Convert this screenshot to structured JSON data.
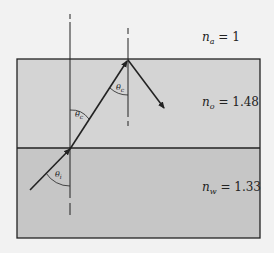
{
  "diagram": {
    "type": "optics-refraction-total-internal-reflection",
    "colors": {
      "background": "#f2f2f2",
      "oil_layer": "#d4d4d4",
      "water_layer": "#c6c6c6",
      "lines": "#222222"
    },
    "media": [
      {
        "name": "air",
        "symbol": "n",
        "subscript": "a",
        "value": "1"
      },
      {
        "name": "oil",
        "symbol": "n",
        "subscript": "o",
        "value": "1.48"
      },
      {
        "name": "water",
        "symbol": "n",
        "subscript": "w",
        "value": "1.33"
      }
    ],
    "angles": [
      {
        "symbol": "θ",
        "subscript": "i",
        "location": "incident angle in water at lower interface"
      },
      {
        "symbol": "θ",
        "subscript": "c",
        "location": "refracted angle in oil at lower interface"
      },
      {
        "symbol": "θ",
        "subscript": "c",
        "location": "critical angle at oil-air interface"
      }
    ],
    "rays": [
      {
        "segment": "incident",
        "from": [
          30,
          190
        ],
        "to": [
          70,
          149
        ]
      },
      {
        "segment": "refracted",
        "from": [
          70,
          149
        ],
        "to": [
          128,
          60
        ]
      },
      {
        "segment": "reflected",
        "from": [
          128,
          60
        ],
        "to": [
          164,
          108
        ]
      }
    ]
  }
}
